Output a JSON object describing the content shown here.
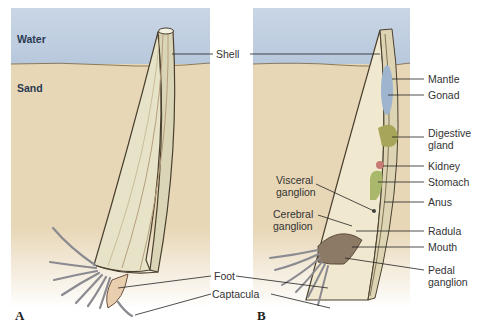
{
  "figure": {
    "panels": [
      {
        "letter": "A",
        "regions": {
          "water": "Water",
          "sand": "Sand"
        }
      },
      {
        "letter": "B"
      }
    ],
    "labels": {
      "shell": "Shell",
      "foot": "Foot",
      "captacula": "Captacula",
      "mantle": "Mantle",
      "gonad": "Gonad",
      "digestive_gland_1": "Digestive",
      "digestive_gland_2": "gland",
      "kidney": "Kidney",
      "stomach": "Stomach",
      "anus": "Anus",
      "radula": "Radula",
      "mouth": "Mouth",
      "pedal_ganglion_1": "Pedal",
      "pedal_ganglion_2": "ganglion",
      "visceral_ganglion_1": "Visceral",
      "visceral_ganglion_2": "ganglion",
      "cerebral_ganglion_1": "Cerebral",
      "cerebral_ganglion_2": "ganglion"
    },
    "colors": {
      "water": "#c3d1e3",
      "sand": "#e8d7b7",
      "shell": "#e6e3c8",
      "gonad": "#9fb4cf",
      "digestive_gland": "#a7a55a",
      "kidney": "#c77a74",
      "stomach": "#a9b86a",
      "foot": "#e9cfae"
    }
  }
}
